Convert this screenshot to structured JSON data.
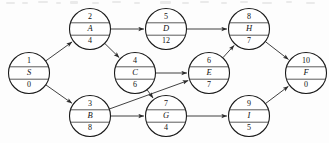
{
  "diagram": {
    "stroke_color": "#2b2b2b",
    "node_fill": "#ffffff",
    "background": "#fdfdfd",
    "node_radius": 20.5,
    "nodes": [
      {
        "id": "n1",
        "number": "1",
        "name": "S",
        "duration": "0",
        "cx": 29,
        "cy": 73
      },
      {
        "id": "n2",
        "number": "2",
        "name": "A",
        "duration": "4",
        "cx": 90,
        "cy": 29
      },
      {
        "id": "n3",
        "number": "3",
        "name": "B",
        "duration": "8",
        "cx": 90,
        "cy": 116
      },
      {
        "id": "n4",
        "number": "4",
        "name": "C",
        "duration": "6",
        "cx": 135,
        "cy": 73
      },
      {
        "id": "n5",
        "number": "5",
        "name": "D",
        "duration": "12",
        "cx": 166,
        "cy": 29
      },
      {
        "id": "n6",
        "number": "6",
        "name": "E",
        "duration": "7",
        "cx": 209,
        "cy": 73
      },
      {
        "id": "n7",
        "number": "7",
        "name": "G",
        "duration": "4",
        "cx": 166,
        "cy": 116
      },
      {
        "id": "n8",
        "number": "8",
        "name": "H",
        "duration": "7",
        "cx": 249,
        "cy": 29
      },
      {
        "id": "n9",
        "number": "9",
        "name": "I",
        "duration": "5",
        "cx": 249,
        "cy": 116
      },
      {
        "id": "n10",
        "number": "10",
        "name": "F",
        "duration": "0",
        "cx": 306,
        "cy": 73
      }
    ],
    "edges": [
      {
        "id": "e1",
        "from": "n1",
        "to": "n2",
        "label": ""
      },
      {
        "id": "e2",
        "from": "n1",
        "to": "n3",
        "label": ""
      },
      {
        "id": "e3",
        "from": "n2",
        "to": "n5",
        "label": ""
      },
      {
        "id": "e4",
        "from": "n2",
        "to": "n4",
        "label": ""
      },
      {
        "id": "e5",
        "from": "n3",
        "to": "n6",
        "label": ""
      },
      {
        "id": "e6",
        "from": "n3",
        "to": "n7",
        "label": ""
      },
      {
        "id": "e7",
        "from": "n4",
        "to": "n6",
        "label": ""
      },
      {
        "id": "e8",
        "from": "n4",
        "to": "n7",
        "label": ""
      },
      {
        "id": "e9",
        "from": "n5",
        "to": "n8",
        "label": ""
      },
      {
        "id": "e10",
        "from": "n6",
        "to": "n8",
        "label": ""
      },
      {
        "id": "e11",
        "from": "n7",
        "to": "n9",
        "label": ""
      },
      {
        "id": "e12",
        "from": "n8",
        "to": "n10",
        "label": ""
      },
      {
        "id": "e13",
        "from": "n9",
        "to": "n10",
        "label": ""
      }
    ]
  }
}
